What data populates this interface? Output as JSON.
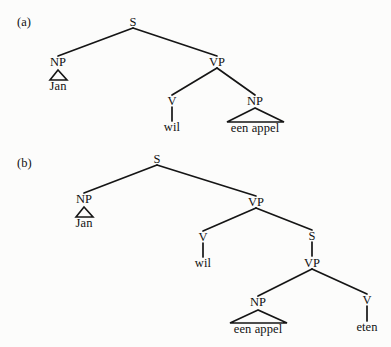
{
  "figure": {
    "kind": "syntax-tree-diagram",
    "background_color": "#fcfcfb",
    "line_color": "#151515",
    "text_color": "#111111",
    "width": 391,
    "height": 347
  },
  "panels": [
    {
      "id": "a",
      "label": "(a)",
      "label_x": 17,
      "label_y": 16,
      "sentence": "Jan wil een appel",
      "nodes": [
        {
          "name": "s-root",
          "text": "S",
          "x": 133,
          "y": 22
        },
        {
          "name": "np-subject",
          "text": "NP",
          "x": 58,
          "y": 62
        },
        {
          "name": "vp",
          "text": "VP",
          "x": 217,
          "y": 62
        },
        {
          "name": "v-wil",
          "text": "V",
          "x": 172,
          "y": 101
        },
        {
          "name": "np-object",
          "text": "NP",
          "x": 255,
          "y": 101
        }
      ],
      "terminals": [
        {
          "name": "terminal-jan",
          "text": "Jan",
          "x": 58,
          "y": 86
        },
        {
          "name": "terminal-wil",
          "text": "wil",
          "x": 172,
          "y": 127
        },
        {
          "name": "terminal-een-appel",
          "text": "een appel",
          "x": 255,
          "y": 128
        }
      ],
      "branches": [
        {
          "name": "branch-s-np",
          "x1": 133,
          "y1": 28,
          "x2": 58,
          "y2": 56
        },
        {
          "name": "branch-s-vp",
          "x1": 133,
          "y1": 28,
          "x2": 217,
          "y2": 56
        },
        {
          "name": "branch-vp-v",
          "x1": 217,
          "y1": 68,
          "x2": 172,
          "y2": 95
        },
        {
          "name": "branch-vp-np",
          "x1": 217,
          "y1": 68,
          "x2": 255,
          "y2": 95
        },
        {
          "name": "branch-v-wil",
          "x1": 172,
          "y1": 107,
          "x2": 172,
          "y2": 121
        }
      ],
      "triangles": [
        {
          "name": "triangle-jan",
          "apex_x": 58,
          "apex_y": 70,
          "left_x": 50,
          "right_x": 67,
          "base_y": 80
        },
        {
          "name": "triangle-een-appel",
          "apex_x": 255,
          "apex_y": 108,
          "left_x": 227,
          "right_x": 284,
          "base_y": 122
        }
      ]
    },
    {
      "id": "b",
      "label": "(b)",
      "label_x": 17,
      "label_y": 157,
      "sentence": "Jan wil een appel eten",
      "nodes": [
        {
          "name": "s-root",
          "text": "S",
          "x": 157,
          "y": 159
        },
        {
          "name": "np-subject",
          "text": "NP",
          "x": 84,
          "y": 199
        },
        {
          "name": "vp-matrix",
          "text": "VP",
          "x": 256,
          "y": 202
        },
        {
          "name": "v-wil",
          "text": "V",
          "x": 203,
          "y": 237
        },
        {
          "name": "s-embedded",
          "text": "S",
          "x": 312,
          "y": 236
        },
        {
          "name": "vp-embedded",
          "text": "VP",
          "x": 312,
          "y": 263
        },
        {
          "name": "np-object",
          "text": "NP",
          "x": 258,
          "y": 302
        },
        {
          "name": "v-eten",
          "text": "V",
          "x": 367,
          "y": 300
        }
      ],
      "terminals": [
        {
          "name": "terminal-jan",
          "text": "Jan",
          "x": 84,
          "y": 223
        },
        {
          "name": "terminal-wil",
          "text": "wil",
          "x": 203,
          "y": 263
        },
        {
          "name": "terminal-een-appel",
          "text": "een appel",
          "x": 258,
          "y": 329
        },
        {
          "name": "terminal-eten",
          "text": "eten",
          "x": 367,
          "y": 327
        }
      ],
      "branches": [
        {
          "name": "branch-s-np",
          "x1": 157,
          "y1": 165,
          "x2": 84,
          "y2": 193
        },
        {
          "name": "branch-s-vp",
          "x1": 157,
          "y1": 165,
          "x2": 256,
          "y2": 196
        },
        {
          "name": "branch-vp-v",
          "x1": 256,
          "y1": 208,
          "x2": 203,
          "y2": 231
        },
        {
          "name": "branch-vp-s",
          "x1": 256,
          "y1": 208,
          "x2": 312,
          "y2": 230
        },
        {
          "name": "branch-v-wil",
          "x1": 203,
          "y1": 243,
          "x2": 203,
          "y2": 257
        },
        {
          "name": "branch-s-vp-inner",
          "x1": 312,
          "y1": 242,
          "x2": 312,
          "y2": 256
        },
        {
          "name": "branch-vp-np",
          "x1": 312,
          "y1": 269,
          "x2": 258,
          "y2": 296
        },
        {
          "name": "branch-vp-v-eten",
          "x1": 312,
          "y1": 269,
          "x2": 367,
          "y2": 294
        },
        {
          "name": "branch-v-eten",
          "x1": 367,
          "y1": 306,
          "x2": 367,
          "y2": 321
        }
      ],
      "triangles": [
        {
          "name": "triangle-jan",
          "apex_x": 84,
          "apex_y": 207,
          "left_x": 76,
          "right_x": 93,
          "base_y": 217
        },
        {
          "name": "triangle-een-appel",
          "apex_x": 258,
          "apex_y": 310,
          "left_x": 230,
          "right_x": 287,
          "base_y": 323
        }
      ]
    }
  ]
}
